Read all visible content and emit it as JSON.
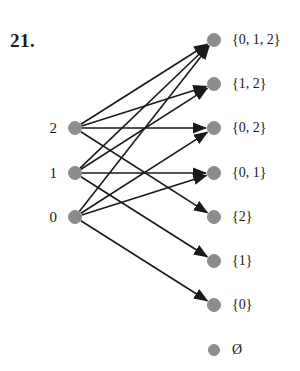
{
  "figure": {
    "number_label": "21.",
    "number_pos": {
      "x": 10,
      "y": 30
    },
    "colors": {
      "node_fill": "#8c8c8c",
      "node_stroke": "#8c8c8c",
      "edge": "#1a1a1a",
      "text": "#1a1a1a",
      "background": "#ffffff"
    },
    "node_radius": 6.5,
    "small_node_radius": 5.5,
    "edge_width": 1.6
  },
  "left_nodes": [
    {
      "id": "e2",
      "label": "2",
      "x": 75,
      "y": 128
    },
    {
      "id": "e1",
      "label": "1",
      "x": 75,
      "y": 173
    },
    {
      "id": "e0",
      "label": "0",
      "x": 75,
      "y": 217
    }
  ],
  "right_nodes": [
    {
      "id": "s012",
      "label": "{0, 1, 2}",
      "x": 214,
      "y": 40
    },
    {
      "id": "s12",
      "label": "{1, 2}",
      "x": 214,
      "y": 84
    },
    {
      "id": "s02",
      "label": "{0, 2}",
      "x": 214,
      "y": 128
    },
    {
      "id": "s01",
      "label": "{0, 1}",
      "x": 214,
      "y": 173
    },
    {
      "id": "s2",
      "label": "{2}",
      "x": 214,
      "y": 217
    },
    {
      "id": "s1",
      "label": "{1}",
      "x": 214,
      "y": 261
    },
    {
      "id": "s0",
      "label": "{0}",
      "x": 214,
      "y": 305
    },
    {
      "id": "sempty",
      "label": "Ø",
      "x": 214,
      "y": 350,
      "small": true
    }
  ],
  "edges": [
    {
      "from": "e2",
      "to": "s012"
    },
    {
      "from": "e2",
      "to": "s12"
    },
    {
      "from": "e2",
      "to": "s02"
    },
    {
      "from": "e2",
      "to": "s2"
    },
    {
      "from": "e1",
      "to": "s012"
    },
    {
      "from": "e1",
      "to": "s12"
    },
    {
      "from": "e1",
      "to": "s01"
    },
    {
      "from": "e1",
      "to": "s1"
    },
    {
      "from": "e0",
      "to": "s012"
    },
    {
      "from": "e0",
      "to": "s02"
    },
    {
      "from": "e0",
      "to": "s01"
    },
    {
      "from": "e0",
      "to": "s0"
    }
  ],
  "label_offsets": {
    "left_label_dx": -18,
    "right_label_dx": 18
  }
}
